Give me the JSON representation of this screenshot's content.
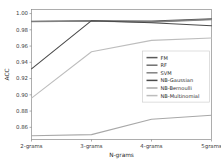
{
  "chart_data": {
    "type": "line",
    "title": "",
    "xlabel": "N-grams",
    "ylabel": "ACC",
    "categories": [
      "2-grams",
      "3-grams",
      "4-grams",
      "5grams"
    ],
    "ylim": [
      0.845,
      1.005
    ],
    "xlim": [
      0,
      3
    ],
    "grid": false,
    "legend_position": "center-right",
    "yticks": [
      "1.00",
      "0.98",
      "0.96",
      "0.94",
      "0.92",
      "0.90",
      "0.88",
      "0.86"
    ],
    "ytick_values": [
      1.0,
      0.98,
      0.96,
      0.94,
      0.92,
      0.9,
      0.88,
      0.86
    ],
    "series": [
      {
        "name": "FM",
        "color": "#5a5a5a",
        "values": [
          0.9905,
          0.991,
          0.9908,
          0.9935
        ]
      },
      {
        "name": "RF",
        "color": "#6f6f6f",
        "values": [
          0.9903,
          0.9907,
          0.99,
          0.993
        ]
      },
      {
        "name": "SVM",
        "color": "#828282",
        "values": [
          0.99,
          0.9905,
          0.9892,
          0.9925
        ]
      },
      {
        "name": "NB-Gaussian",
        "color": "#4a4a4a",
        "values": [
          0.932,
          0.9912,
          0.9888,
          0.985
        ]
      },
      {
        "name": "NB-Bernoulli",
        "color": "#a8a8a8",
        "values": [
          0.8497,
          0.851,
          0.87,
          0.8748
        ]
      },
      {
        "name": "NB-Multinomial",
        "color": "#bdbdbd",
        "values": [
          0.896,
          0.953,
          0.967,
          0.97
        ]
      }
    ]
  },
  "legend": {
    "items": [
      {
        "label": "FM"
      },
      {
        "label": "RF"
      },
      {
        "label": "SVM"
      },
      {
        "label": "NB-Gaussian"
      },
      {
        "label": "NB-Bernoulli"
      },
      {
        "label": "NB-Multinomial"
      }
    ]
  }
}
